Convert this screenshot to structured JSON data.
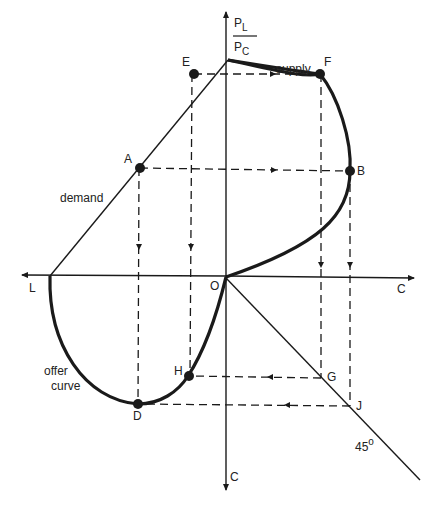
{
  "diagram": {
    "vertical_axis_label": {
      "numerator": "P",
      "numerator_sub": "L",
      "denominator": "P",
      "denominator_sub": "C"
    },
    "horizontal_axis_right_label": "C",
    "horizontal_axis_left_label": "L",
    "vertical_axis_bottom_label": "C",
    "origin_label": "O",
    "curve_labels": {
      "supply": "supply",
      "demand": "demand",
      "offer_curve_line1": "offer",
      "offer_curve_line2": "curve",
      "angle": "45",
      "degree": "o"
    },
    "points": {
      "A": "A",
      "B": "B",
      "D": "D",
      "E": "E",
      "F": "F",
      "G": "G",
      "H": "H",
      "J": "J"
    },
    "colors": {
      "ink": "#1a1a1a",
      "background": "#ffffff"
    }
  }
}
